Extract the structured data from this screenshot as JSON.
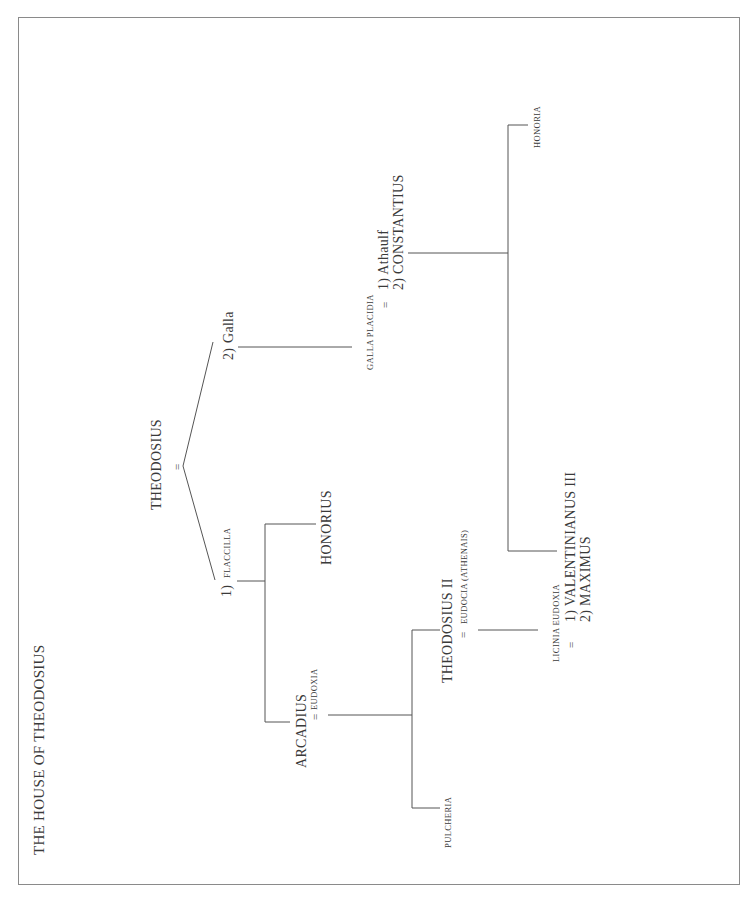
{
  "title": "THE HOUSE OF THEODOSIUS",
  "marriage_symbol": "=",
  "people": {
    "theodosius": "THEODOSIUS",
    "flaccilla_num": "1)",
    "flaccilla": "FLACCILLA",
    "galla_num": "2)",
    "galla": "Galla",
    "honorius": "HONORIUS",
    "arcadius": "ARCADIUS",
    "eudoxia": "EUDOXIA",
    "theodosius_ii": "THEODOSIUS II",
    "eudocia": "EUDOCIA (ATHENAIS)",
    "pulcheria": "PULCHERIA",
    "licinia_eudoxia": "LICINIA EUDOXIA",
    "valentinianus": "1)  VALENTINIANUS III",
    "maximus": "2)  MAXIMUS",
    "galla_placidia": "GALLA PLACIDIA",
    "athaulf": "1)  Athaulf",
    "constantius": "2)  CONSTANTIUS",
    "honoria": "HONORIA"
  }
}
